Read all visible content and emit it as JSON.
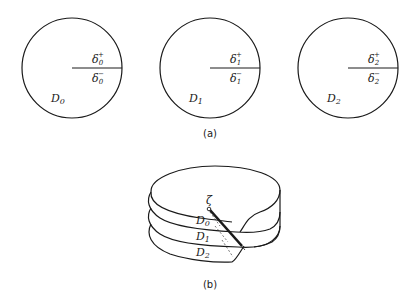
{
  "figure_a": {
    "caption": "(a)",
    "disks": [
      {
        "label": "D",
        "sub": "0",
        "upper": "δ",
        "upper_sub": "0",
        "upper_sup": "+",
        "lower": "δ",
        "lower_sub": "0",
        "lower_sup": "−"
      },
      {
        "label": "D",
        "sub": "1",
        "upper": "δ",
        "upper_sub": "1",
        "upper_sup": "+",
        "lower": "δ",
        "lower_sub": "1",
        "lower_sup": "−"
      },
      {
        "label": "D",
        "sub": "2",
        "upper": "δ",
        "upper_sub": "2",
        "upper_sup": "+",
        "lower": "δ",
        "lower_sub": "2",
        "lower_sup": "−"
      }
    ]
  },
  "figure_b": {
    "caption": "(b)",
    "point_label": "ζ",
    "layers": [
      {
        "label": "D",
        "sub": "0"
      },
      {
        "label": "D",
        "sub": "1"
      },
      {
        "label": "D",
        "sub": "2"
      }
    ]
  }
}
